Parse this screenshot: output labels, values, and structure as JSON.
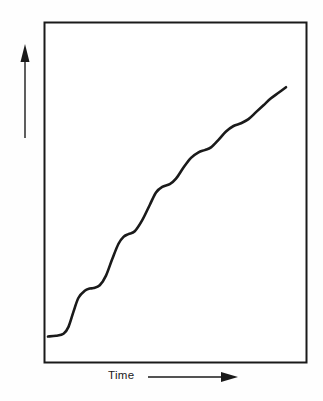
{
  "figure": {
    "caption": "",
    "background_color": "#ffffff",
    "line_color": "#1a1a1a",
    "frame_color": "#1a1a1a"
  },
  "axes": {
    "y_label": "Log number of viable cel s",
    "x_label": "Time",
    "y_arrow_icon": "up-arrow-icon",
    "x_arrow_icon": "right-arrow-icon",
    "frame": {
      "left": 44,
      "top": 22,
      "right": 307,
      "bottom": 363
    }
  },
  "chart_data": {
    "type": "line",
    "title": "",
    "xlabel": "Time",
    "ylabel": "Log number of viable cel s",
    "xlim": [
      0,
      100
    ],
    "ylim": [
      0,
      100
    ],
    "grid": false,
    "legend": null,
    "axis_ticks": {
      "x": [],
      "y": []
    },
    "series": [
      {
        "name": "Viable cell count",
        "x": [
          0.8,
          4.0,
          7.0,
          9.0,
          11.0,
          13.0,
          15.5,
          17.5,
          19.0,
          21.5,
          24.0,
          26.5,
          29.0,
          31.0,
          33.0,
          35.5,
          38.5,
          41.5,
          44.0,
          46.5,
          49.5,
          52.0,
          55.0,
          58.0,
          61.0,
          63.5,
          66.0,
          69.0,
          72.0,
          75.0,
          78.0,
          81.0,
          84.0,
          87.0,
          90.0,
          93.0,
          96.0
        ],
        "y": [
          4.5,
          4.8,
          5.5,
          8.0,
          13.5,
          18.5,
          21.0,
          21.8,
          22.0,
          23.0,
          26.5,
          32.5,
          38.0,
          40.5,
          41.5,
          42.5,
          46.5,
          52.0,
          56.5,
          58.5,
          59.5,
          61.5,
          65.5,
          69.0,
          71.0,
          71.8,
          72.8,
          75.5,
          78.5,
          80.5,
          81.5,
          83.0,
          85.5,
          88.0,
          90.5,
          92.5,
          94.5
        ]
      }
    ],
    "step_plateaus": [
      {
        "index": 1,
        "x_center": 2.5,
        "y_level": 4.6
      },
      {
        "index": 2,
        "x_center": 18.0,
        "y_level": 21.8
      },
      {
        "index": 3,
        "x_center": 33.5,
        "y_level": 42.0
      },
      {
        "index": 4,
        "x_center": 50.5,
        "y_level": 60.0
      },
      {
        "index": 5,
        "x_center": 65.0,
        "y_level": 72.0
      },
      {
        "index": 6,
        "x_center": 79.5,
        "y_level": 81.0
      }
    ]
  }
}
